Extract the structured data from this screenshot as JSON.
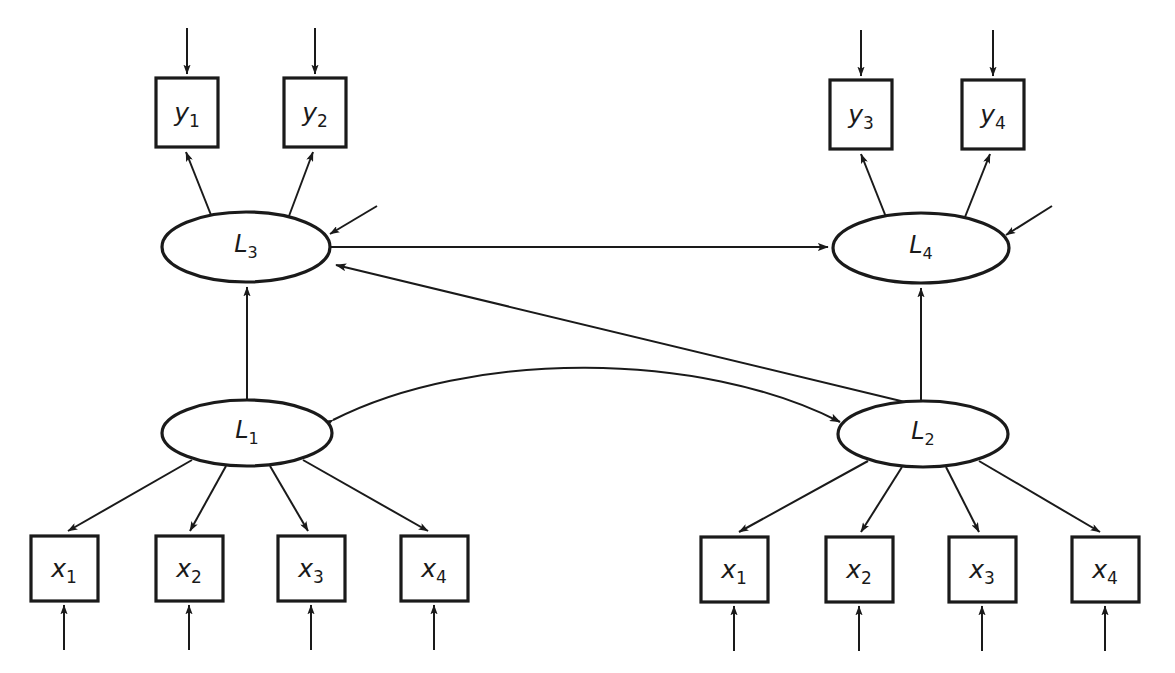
{
  "diagram": {
    "type": "structural-equation-model-path-diagram",
    "canvas": {
      "width": 1175,
      "height": 673
    },
    "colors": {
      "stroke": "#1a1a1a",
      "fill": "#ffffff",
      "background": "#ffffff"
    },
    "observed_variables": [
      {
        "id": "y1",
        "base": "y",
        "sub": "1",
        "shape": "rectangle",
        "x": 156,
        "y": 78,
        "w": 62,
        "h": 69
      },
      {
        "id": "y2",
        "base": "y",
        "sub": "2",
        "shape": "rectangle",
        "x": 284,
        "y": 78,
        "w": 62,
        "h": 69
      },
      {
        "id": "y3",
        "base": "y",
        "sub": "3",
        "shape": "rectangle",
        "x": 830,
        "y": 80,
        "w": 62,
        "h": 69
      },
      {
        "id": "y4",
        "base": "y",
        "sub": "4",
        "shape": "rectangle",
        "x": 962,
        "y": 80,
        "w": 62,
        "h": 69
      },
      {
        "id": "lx1",
        "base": "x",
        "sub": "1",
        "shape": "rectangle",
        "x": 31,
        "y": 536,
        "w": 67,
        "h": 65
      },
      {
        "id": "lx2",
        "base": "x",
        "sub": "2",
        "shape": "rectangle",
        "x": 156,
        "y": 536,
        "w": 67,
        "h": 65
      },
      {
        "id": "lx3",
        "base": "x",
        "sub": "3",
        "shape": "rectangle",
        "x": 278,
        "y": 536,
        "w": 67,
        "h": 65
      },
      {
        "id": "lx4",
        "base": "x",
        "sub": "4",
        "shape": "rectangle",
        "x": 401,
        "y": 536,
        "w": 67,
        "h": 65
      },
      {
        "id": "rx1",
        "base": "x",
        "sub": "1",
        "shape": "rectangle",
        "x": 701,
        "y": 537,
        "w": 67,
        "h": 65
      },
      {
        "id": "rx2",
        "base": "x",
        "sub": "2",
        "shape": "rectangle",
        "x": 826,
        "y": 537,
        "w": 67,
        "h": 65
      },
      {
        "id": "rx3",
        "base": "x",
        "sub": "3",
        "shape": "rectangle",
        "x": 949,
        "y": 537,
        "w": 67,
        "h": 65
      },
      {
        "id": "rx4",
        "base": "x",
        "sub": "4",
        "shape": "rectangle",
        "x": 1072,
        "y": 537,
        "w": 67,
        "h": 65
      }
    ],
    "latent_variables": [
      {
        "id": "L3",
        "base": "L",
        "sub": "3",
        "shape": "ellipse",
        "cx": 246,
        "cy": 247,
        "rx": 84,
        "ry": 35
      },
      {
        "id": "L4",
        "base": "L",
        "sub": "4",
        "shape": "ellipse",
        "cx": 921,
        "cy": 248,
        "rx": 88,
        "ry": 35
      },
      {
        "id": "L1",
        "base": "L",
        "sub": "1",
        "shape": "ellipse",
        "cx": 247,
        "cy": 433,
        "rx": 85,
        "ry": 33
      },
      {
        "id": "L2",
        "base": "L",
        "sub": "2",
        "shape": "ellipse",
        "cx": 923,
        "cy": 434,
        "rx": 85,
        "ry": 33
      }
    ],
    "edges": [
      {
        "id": "e-L3-y1",
        "from": "L3",
        "to": "y1",
        "kind": "loading-arrow",
        "arrow": "single"
      },
      {
        "id": "e-L3-y2",
        "from": "L3",
        "to": "y2",
        "kind": "loading-arrow",
        "arrow": "single"
      },
      {
        "id": "e-L4-y3",
        "from": "L4",
        "to": "y3",
        "kind": "loading-arrow",
        "arrow": "single"
      },
      {
        "id": "e-L4-y4",
        "from": "L4",
        "to": "y4",
        "kind": "loading-arrow",
        "arrow": "single"
      },
      {
        "id": "e-L1-lx1",
        "from": "L1",
        "to": "lx1",
        "kind": "loading-arrow",
        "arrow": "single"
      },
      {
        "id": "e-L1-lx2",
        "from": "L1",
        "to": "lx2",
        "kind": "loading-arrow",
        "arrow": "single"
      },
      {
        "id": "e-L1-lx3",
        "from": "L1",
        "to": "lx3",
        "kind": "loading-arrow",
        "arrow": "single"
      },
      {
        "id": "e-L1-lx4",
        "from": "L1",
        "to": "lx4",
        "kind": "loading-arrow",
        "arrow": "single"
      },
      {
        "id": "e-L2-rx1",
        "from": "L2",
        "to": "rx1",
        "kind": "loading-arrow",
        "arrow": "single"
      },
      {
        "id": "e-L2-rx2",
        "from": "L2",
        "to": "rx2",
        "kind": "loading-arrow",
        "arrow": "single"
      },
      {
        "id": "e-L2-rx3",
        "from": "L2",
        "to": "rx3",
        "kind": "loading-arrow",
        "arrow": "single"
      },
      {
        "id": "e-L2-rx4",
        "from": "L2",
        "to": "rx4",
        "kind": "loading-arrow",
        "arrow": "single"
      },
      {
        "id": "e-L1-L3",
        "from": "L1",
        "to": "L3",
        "kind": "structural-path",
        "arrow": "single"
      },
      {
        "id": "e-L2-L4",
        "from": "L2",
        "to": "L4",
        "kind": "structural-path",
        "arrow": "single"
      },
      {
        "id": "e-L3-L4",
        "from": "L3",
        "to": "L4",
        "kind": "structural-path",
        "arrow": "single"
      },
      {
        "id": "e-L2-L3",
        "from": "L2",
        "to": "L3",
        "kind": "structural-path",
        "arrow": "single"
      },
      {
        "id": "e-L1-L2-cov",
        "from": "L1",
        "to": "L2",
        "kind": "covariance-curve",
        "arrow": "double"
      }
    ],
    "residuals": [
      {
        "id": "d-L3",
        "target": "L3",
        "kind": "disturbance-arrow"
      },
      {
        "id": "d-L4",
        "target": "L4",
        "kind": "disturbance-arrow"
      },
      {
        "id": "e-y1",
        "target": "y1",
        "kind": "measurement-error-arrow"
      },
      {
        "id": "e-y2",
        "target": "y2",
        "kind": "measurement-error-arrow"
      },
      {
        "id": "e-y3",
        "target": "y3",
        "kind": "measurement-error-arrow"
      },
      {
        "id": "e-y4",
        "target": "y4",
        "kind": "measurement-error-arrow"
      },
      {
        "id": "e-lx1",
        "target": "lx1",
        "kind": "measurement-error-arrow"
      },
      {
        "id": "e-lx2",
        "target": "lx2",
        "kind": "measurement-error-arrow"
      },
      {
        "id": "e-lx3",
        "target": "lx3",
        "kind": "measurement-error-arrow"
      },
      {
        "id": "e-lx4",
        "target": "lx4",
        "kind": "measurement-error-arrow"
      },
      {
        "id": "e-rx1",
        "target": "rx1",
        "kind": "measurement-error-arrow"
      },
      {
        "id": "e-rx2",
        "target": "rx2",
        "kind": "measurement-error-arrow"
      },
      {
        "id": "e-rx3",
        "target": "rx3",
        "kind": "measurement-error-arrow"
      },
      {
        "id": "e-rx4",
        "target": "rx4",
        "kind": "measurement-error-arrow"
      }
    ],
    "labels": {
      "y1": "y",
      "y1_sub": "1",
      "y2": "y",
      "y2_sub": "2",
      "y3": "y",
      "y3_sub": "3",
      "y4": "y",
      "y4_sub": "4",
      "lx1": "x",
      "lx1_sub": "1",
      "lx2": "x",
      "lx2_sub": "2",
      "lx3": "x",
      "lx3_sub": "3",
      "lx4": "x",
      "lx4_sub": "4",
      "rx1": "x",
      "rx1_sub": "1",
      "rx2": "x",
      "rx2_sub": "2",
      "rx3": "x",
      "rx3_sub": "3",
      "rx4": "x",
      "rx4_sub": "4",
      "L1": "L",
      "L1_sub": "1",
      "L2": "L",
      "L2_sub": "2",
      "L3": "L",
      "L3_sub": "3",
      "L4": "L",
      "L4_sub": "4"
    }
  }
}
